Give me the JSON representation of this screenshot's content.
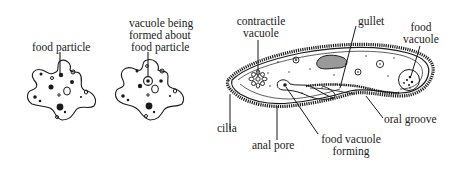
{
  "diagram": {
    "colors": {
      "ink": "#1a1a1a",
      "background": "#ffffff",
      "hatch": "#8a8a8a"
    },
    "panels": [
      {
        "id": "amoeba-1",
        "labels": [
          {
            "id": "food-particle",
            "text": "food particle"
          }
        ]
      },
      {
        "id": "amoeba-2",
        "labels": [
          {
            "id": "vacuole-forming",
            "lines": [
              "vacuole being",
              "formed about",
              "food particle"
            ]
          }
        ]
      },
      {
        "id": "paramecium",
        "labels": [
          {
            "id": "contractile-vacuole",
            "lines": [
              "contractile",
              "vacuole"
            ]
          },
          {
            "id": "gullet",
            "text": "gullet"
          },
          {
            "id": "food-vacuole",
            "lines": [
              "food",
              "vacuole"
            ]
          },
          {
            "id": "cilia",
            "text": "cilia"
          },
          {
            "id": "anal-pore",
            "text": "anal pore"
          },
          {
            "id": "food-vacuole-forming",
            "lines": [
              "food vacuole",
              "forming"
            ]
          },
          {
            "id": "oral-groove",
            "text": "oral groove"
          }
        ]
      }
    ]
  }
}
